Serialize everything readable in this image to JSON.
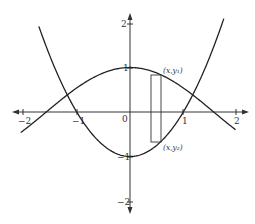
{
  "diagram": {
    "type": "function-plot",
    "curves": [
      {
        "name": "upper-curve",
        "expression": "y = cos(x)"
      },
      {
        "name": "lower-curve",
        "expression": "y = x^2 - 1"
      }
    ],
    "x_ticks": [
      "−2",
      "−1",
      "0",
      "1",
      "2"
    ],
    "y_ticks": [
      "2",
      "1",
      "−1",
      "−2"
    ],
    "labels": {
      "top_point": "(x,y₁)",
      "bottom_point": "(x,y₂)"
    },
    "representative_rectangle": {
      "x_from": 0.4,
      "x_to": 0.58
    }
  }
}
